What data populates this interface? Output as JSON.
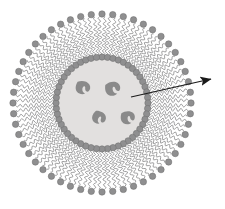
{
  "figure": {
    "background_color": "#ffffff",
    "width": 225,
    "height": 209
  },
  "colors": {
    "core_fill": "#e2e0df",
    "core_edge": "#d8d6d5",
    "head_fill": "#8f8f90",
    "head_stroke": "#6f6f70",
    "tail_stroke": "#8c8c8e",
    "cargo_fill": "#8a8a8a",
    "arrow_color": "#1a1a1a",
    "background": "#ffffff"
  },
  "structure": {
    "center_x": 102,
    "center_y": 103,
    "core_radius": 46,
    "inner_head_radius": 46,
    "tail_inner_radius": 48,
    "tail_outer_radius": 86,
    "outer_head_radius": 89,
    "lipid_count": 52,
    "tails_per_lipid": 2,
    "head_radius_px": 3.2,
    "tail_wave_amplitude": 2.1,
    "tail_wave_periods": 7,
    "tail_pair_offset_deg": 1.9
  },
  "core_cargo": {
    "label": "encapsulated drug particles",
    "count": 4,
    "particles": [
      {
        "cx": 83,
        "cy": 88,
        "scale": 1.0,
        "rotation": 8
      },
      {
        "cx": 113,
        "cy": 89,
        "scale": 1.05,
        "rotation": -14
      },
      {
        "cx": 99,
        "cy": 118,
        "scale": 0.95,
        "rotation": 24
      },
      {
        "cx": 128,
        "cy": 118,
        "scale": 0.98,
        "rotation": -6
      }
    ]
  },
  "annotation_arrow": {
    "label": "pointer to core contents",
    "start_x": 131,
    "start_y": 97,
    "end_x": 211,
    "end_y": 79,
    "stroke_width": 1.1,
    "head_length": 11,
    "head_width": 8,
    "caption": ""
  },
  "legend": {
    "visible": false,
    "entries": []
  }
}
